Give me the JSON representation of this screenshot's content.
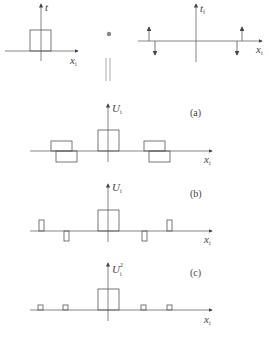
{
  "figure": {
    "top_left": {
      "y_label": "t",
      "x_label": "x",
      "x_sub": "i"
    },
    "operator": "∗",
    "top_right": {
      "y_label": "t",
      "y_sub": "f",
      "x_label": "x",
      "x_sub": "i"
    },
    "equals": "||",
    "panel_a": {
      "caption": "(a)",
      "y_label": "U",
      "y_sub": "i",
      "x_label": "x",
      "x_sub": "i"
    },
    "panel_b": {
      "caption": "(b)",
      "y_label": "U",
      "y_sub": "i",
      "x_label": "x",
      "x_sub": "i"
    },
    "panel_c": {
      "caption": "(c)",
      "y_label": "U",
      "y_sub": "i",
      "y_sup": "2",
      "x_label": "x",
      "x_sub": "i"
    }
  }
}
